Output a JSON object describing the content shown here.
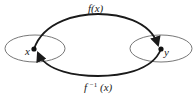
{
  "diagram": {
    "title": "",
    "nodes": [
      {
        "id": "x",
        "label": "x",
        "set": "domain"
      },
      {
        "id": "y",
        "label": "y",
        "set": "codomain"
      }
    ],
    "edges": [
      {
        "from": "x",
        "to": "y",
        "label": "f(x)",
        "position": "top"
      },
      {
        "from": "y",
        "to": "x",
        "label": "f⁻¹(x)",
        "position": "bottom"
      }
    ],
    "labels": {
      "forward": "f(x)",
      "inverse_base": "f",
      "inverse_sup": "−1",
      "inverse_arg": "(x)",
      "x": "x",
      "y": "y"
    },
    "colors": {
      "line": "#1a1a1a",
      "ellipse": "#666666",
      "background": "#ffffff"
    }
  }
}
